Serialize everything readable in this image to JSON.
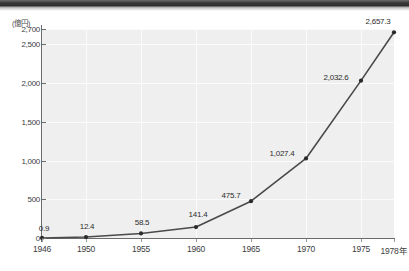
{
  "chart_data": {
    "type": "line",
    "title": "",
    "unit_caption": "(億円)",
    "xlabel": "",
    "ylabel": "",
    "axis_suffix": "年",
    "grid": true,
    "legend": "none",
    "xlim": [
      1946,
      1978
    ],
    "ylim": [
      0,
      2700
    ],
    "x": [
      1946,
      1950,
      1955,
      1960,
      1965,
      1970,
      1975,
      1978
    ],
    "categories": [
      "1946",
      "1950",
      "1955",
      "1960",
      "1965",
      "1970",
      "1975",
      "1978年"
    ],
    "values": [
      0.9,
      12.4,
      58.5,
      141.4,
      475.7,
      1027.4,
      2032.6,
      2657.3
    ],
    "value_labels": [
      "0.9",
      "12.4",
      "58.5",
      "141.4",
      "475.7",
      "1,027.4",
      "2,032.6",
      "2,657.3"
    ],
    "ytick_values": [
      0,
      500,
      1000,
      1500,
      2000,
      2500,
      2700
    ],
    "ytick_labels": [
      "0",
      "500",
      "1,000",
      "1,500",
      "2,000",
      "2,500",
      "2,700"
    ],
    "xtick_labels": [
      "1946",
      "1950",
      "1955",
      "1960",
      "1965",
      "1970",
      "1975",
      "1978年"
    ],
    "colors": {
      "line": "#4a4a4a",
      "marker": "#2b2b2b",
      "plot_background": "#efefef",
      "gridline": "#fbfbfb",
      "axis": "#6b6b6b",
      "text": "#3d3d3d",
      "page_edge": "#2e2e2e"
    }
  }
}
